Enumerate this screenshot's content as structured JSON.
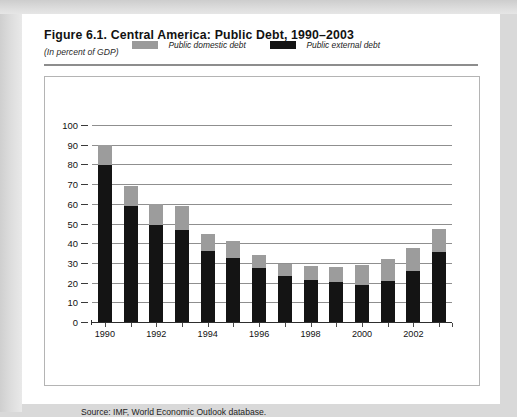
{
  "figure": {
    "title": "Figure 6.1.  Central America: Public Debt, 1990–2003",
    "subtitle": "(In percent of GDP)",
    "source": "Source: IMF, World Economic Outlook database."
  },
  "colors": {
    "public_domestic_debt": "#9c9c9c",
    "public_external_debt": "#141414",
    "gridline": "#8f8f8f",
    "page_background": "#d9d9d9",
    "card_background": "#ffffff"
  },
  "chart_data": {
    "type": "bar",
    "stacked": true,
    "title": "Figure 6.1.  Central America: Public Debt, 1990–2003",
    "subtitle": "(In percent of GDP)",
    "xlabel": "",
    "ylabel": "",
    "ylim": [
      0,
      100
    ],
    "ytick_step": 10,
    "yticks": [
      0,
      10,
      20,
      30,
      40,
      50,
      60,
      70,
      80,
      90,
      100
    ],
    "ytick_labels": [
      "0",
      "10",
      "20",
      "30",
      "40",
      "50",
      "60",
      "70",
      "80",
      "90",
      "100"
    ],
    "grid": true,
    "grid_axis": "y",
    "legend_position": "top-center",
    "categories": [
      1990,
      1991,
      1992,
      1993,
      1994,
      1995,
      1996,
      1997,
      1998,
      1999,
      2000,
      2001,
      2002,
      2003
    ],
    "xtick_labels": [
      "1990",
      "",
      "1992",
      "",
      "1994",
      "",
      "1996",
      "",
      "1998",
      "",
      "2000",
      "",
      "2002",
      ""
    ],
    "series": [
      {
        "name": "Public external debt",
        "color": "#141414",
        "values": [
          79.5,
          59.0,
          49.0,
          46.5,
          36.0,
          32.5,
          27.5,
          23.5,
          21.5,
          20.5,
          19.0,
          21.0,
          26.0,
          35.5
        ]
      },
      {
        "name": "Public domestic debt",
        "color": "#9c9c9c",
        "values": [
          10.5,
          10.0,
          11.0,
          12.5,
          8.5,
          8.5,
          6.5,
          6.0,
          7.0,
          7.5,
          10.0,
          11.0,
          11.5,
          11.5
        ]
      }
    ],
    "totals": [
      90.0,
      69.0,
      60.0,
      59.0,
      44.5,
      41.0,
      34.0,
      29.5,
      28.5,
      28.0,
      29.0,
      32.0,
      37.5,
      47.0
    ]
  },
  "legend": [
    {
      "label": "Public domestic debt",
      "swatch": "gray"
    },
    {
      "label": "Public external debt",
      "swatch": "black"
    }
  ]
}
